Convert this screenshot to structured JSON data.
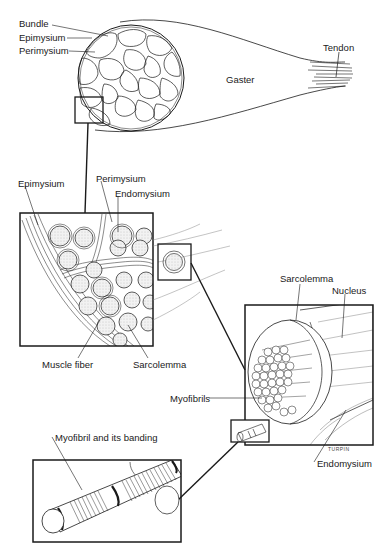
{
  "figure": {
    "signature": "TURPIN"
  },
  "labels": {
    "whole_muscle": {
      "bundle": "Bundle",
      "epimysium": "Epimysium",
      "perimysium": "Perimysium",
      "gaster": "Gaster",
      "tendon": "Tendon"
    },
    "bundle_detail": {
      "epimysium": "Epimysium",
      "perimysium": "Perimysium",
      "endomysium": "Endomysium",
      "muscle_fiber": "Muscle fiber",
      "sarcolemma": "Sarcolemma"
    },
    "fiber_detail": {
      "sarcolemma": "Sarcolemma",
      "nucleus": "Nucleus",
      "myofibrils": "Myofibrils",
      "endomysium": "Endomysium"
    },
    "myofibril_detail": {
      "myofibril_banding": "Myofibril and its banding"
    }
  },
  "colors": {
    "ink": "#1a1a1a",
    "background": "#ffffff",
    "fiber_fill": "#e6e6e6"
  }
}
